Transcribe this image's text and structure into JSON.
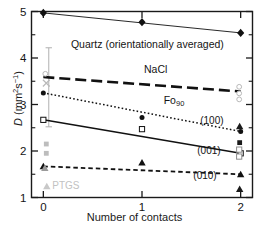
{
  "chart_data": {
    "type": "scatter",
    "title": "",
    "xlabel": "Number of contacts",
    "ylabel": "D (mm²s⁻¹)",
    "ylabel_symbol": "D",
    "ylabel_units": "(mm2s-1)",
    "xlim": [
      -0.12,
      2.12
    ],
    "ylim": [
      1,
      5
    ],
    "xticks": [
      0,
      1,
      2
    ],
    "xtick_labels": [
      "0",
      "1",
      "2"
    ],
    "yticks": [
      1,
      2,
      3,
      4,
      5
    ],
    "ytick_labels": [
      "1",
      "2",
      "3",
      "4",
      "5"
    ],
    "yticks_minor": [
      1.5,
      2.5,
      3.5,
      4.5
    ],
    "grid": false,
    "legend": "none",
    "annotations": [
      {
        "name": "quartz-label",
        "text": "Quartz (orientationally averaged)",
        "x": 0.28,
        "y": 4.28
      },
      {
        "name": "nacl-label",
        "text": "NaCl",
        "x": 1.02,
        "y": 3.74
      },
      {
        "name": "fo90-label",
        "text": "Fo",
        "sub": "90",
        "x": 1.22,
        "y": 3.08
      },
      {
        "name": "plane-100-label",
        "text": "(100)",
        "x": 1.59,
        "y": 2.62
      },
      {
        "name": "plane-001-label",
        "text": "(001)",
        "x": 1.56,
        "y": 1.98
      },
      {
        "name": "plane-010-label",
        "text": "(010)",
        "x": 1.52,
        "y": 1.44
      },
      {
        "name": "ptgs-label",
        "text": "PTGS",
        "x": 0.09,
        "y": 1.23
      }
    ],
    "series": [
      {
        "name": "Quartz (orientationally averaged)",
        "marker": "filled-diamond",
        "line_style": "solid-thin",
        "color": "#111111",
        "x": [
          0,
          1,
          2
        ],
        "values": [
          4.97,
          4.77,
          4.54
        ]
      },
      {
        "name": "NaCl",
        "marker": "none",
        "line_style": "long-dash",
        "color": "#111111",
        "x": [
          0,
          2
        ],
        "values": [
          3.59,
          3.28
        ]
      },
      {
        "name": "Fo90 (100)",
        "marker": "filled-circle",
        "line_style": "dotted",
        "color": "#111111",
        "x": [
          0,
          1,
          2
        ],
        "values": [
          3.25,
          2.72,
          2.42
        ]
      },
      {
        "name": "Fo90 (001)",
        "marker": "open-square",
        "line_style": "solid",
        "color": "#111111",
        "x": [
          0,
          1,
          2
        ],
        "values": [
          2.67,
          2.47,
          1.95
        ]
      },
      {
        "name": "Fo90 (010)",
        "marker": "filled-triangle",
        "line_style": "short-dash",
        "color": "#111111",
        "x": [
          0,
          1,
          2
        ],
        "values": [
          1.67,
          1.75,
          1.5
        ]
      }
    ],
    "extra_points": [
      {
        "name": "gray-open-circle",
        "x": 0.02,
        "y": 3.66,
        "marker": "open-circle",
        "color": "#b9b9b9"
      },
      {
        "name": "gray-x-marker",
        "x": 0.03,
        "y": 3.46,
        "marker": "x",
        "color": "#b9b9b9"
      },
      {
        "name": "gray-square-hi",
        "x": 0.03,
        "y": 2.15,
        "marker": "filled-square",
        "color": "#bdbdbd"
      },
      {
        "name": "gray-square-lo",
        "x": 0.03,
        "y": 1.95,
        "marker": "filled-square",
        "color": "#bdbdbd"
      },
      {
        "name": "gray-triangle-ptgs",
        "x": 0.035,
        "y": 1.24,
        "marker": "filled-triangle",
        "color": "#c8c8c8"
      },
      {
        "name": "gray-triangle-x0",
        "x": 0.015,
        "y": 1.63,
        "marker": "filled-triangle",
        "color": "#9a9a9a"
      },
      {
        "name": "gray-open-circle-x2-a",
        "x": 1.985,
        "y": 3.38,
        "marker": "open-circle",
        "color": "#b9b9b9"
      },
      {
        "name": "gray-open-circle-x2-b",
        "x": 1.985,
        "y": 3.24,
        "marker": "open-circle",
        "color": "#b9b9b9"
      },
      {
        "name": "gray-open-circle-x2-c",
        "x": 1.985,
        "y": 3.11,
        "marker": "open-circle",
        "color": "#b9b9b9"
      },
      {
        "name": "black-square-x2",
        "x": 1.99,
        "y": 2.18,
        "marker": "filled-square",
        "color": "#1a1a1a"
      },
      {
        "name": "open-square-x2-a",
        "x": 1.985,
        "y": 2.03,
        "marker": "open-square",
        "color": "#8e8e8e"
      },
      {
        "name": "open-square-x2-b",
        "x": 1.985,
        "y": 1.88,
        "marker": "open-square",
        "color": "#8e8e8e"
      },
      {
        "name": "black-triangle-x2-lo",
        "x": 1.99,
        "y": 1.18,
        "marker": "filled-triangle",
        "color": "#1a1a1a"
      },
      {
        "name": "black-marker-x2-hi",
        "x": 1.99,
        "y": 2.53,
        "marker": "filled-triangle",
        "color": "#1a1a1a"
      }
    ],
    "error_bars": [
      {
        "name": "errorbar-x0",
        "x": 0.055,
        "y_low": 2.52,
        "y_high": 4.22,
        "color": "#b0b0b0"
      }
    ]
  }
}
